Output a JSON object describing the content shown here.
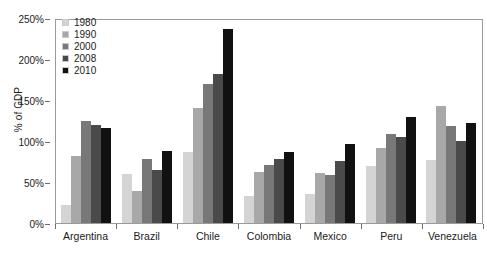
{
  "chart_data": {
    "type": "bar",
    "title": "",
    "subtitle": "",
    "xlabel": "",
    "ylabel": "% of GDP",
    "ylim": [
      0,
      250
    ],
    "y_tick_values": [
      0,
      50,
      100,
      150,
      200,
      250
    ],
    "y_tick_labels": [
      "0%",
      "50%",
      "100%",
      "150%",
      "200%",
      "250%"
    ],
    "grid": false,
    "legend_position": "top-left",
    "categories": [
      "Argentina",
      "Brazil",
      "Chile",
      "Colombia",
      "Mexico",
      "Peru",
      "Venezuela"
    ],
    "series": [
      {
        "name": "1980",
        "color": "#d4d4d4",
        "values": [
          22,
          60,
          87,
          33,
          35,
          70,
          77
        ]
      },
      {
        "name": "1990",
        "color": "#a8a8a8",
        "values": [
          82,
          39,
          140,
          62,
          61,
          92,
          143
        ]
      },
      {
        "name": "2000",
        "color": "#787878",
        "values": [
          125,
          78,
          170,
          71,
          59,
          109,
          118
        ]
      },
      {
        "name": "2008",
        "color": "#4a4a4a",
        "values": [
          119,
          65,
          182,
          78,
          76,
          105,
          100
        ]
      },
      {
        "name": "2010",
        "color": "#111111",
        "values": [
          116,
          88,
          237,
          87,
          96,
          129,
          122
        ]
      }
    ]
  },
  "style": {
    "plot_border_color": "#9a9a9a",
    "axis_color": "#6d6d6d",
    "text_color": "#1b1b1b",
    "background": "#ffffff"
  }
}
